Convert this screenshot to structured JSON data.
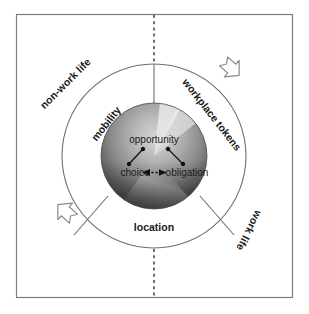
{
  "figure": {
    "frame": {
      "border_color": "#7a7a7a",
      "background": "#ffffff"
    },
    "divider": {
      "name": "vertical-dashed-divider",
      "style": "dashed",
      "color": "#555555",
      "description": "vertical dashed line splitting non-work life from work life"
    },
    "quadrant_labels": [
      {
        "key": "non_work_life",
        "text": "non-work life",
        "position": "upper-left",
        "rotation": -45
      },
      {
        "key": "workplace_tokens",
        "text": "workplace tokens",
        "position": "upper-right",
        "rotation": 52
      },
      {
        "key": "work_life",
        "text": "work life",
        "position": "lower-right",
        "rotation": 117
      }
    ],
    "ring": {
      "name": "outer-ring",
      "stroke": "#6f6f6f",
      "fill": "#ffffff",
      "segments": [
        {
          "key": "mobility",
          "text": "mobility",
          "position": "upper-left",
          "rotation": -52
        },
        {
          "key": "workplace_tokens_ring",
          "text": "workplace tokens",
          "position": "upper-right",
          "rotation": 52
        },
        {
          "key": "location",
          "text": "location",
          "position": "bottom",
          "rotation": 0
        }
      ]
    },
    "core": {
      "name": "inner-sphere",
      "gradient_light": "#d8d8d8",
      "gradient_mid": "#8e8e8e",
      "gradient_dark": "#3b3b3b",
      "nodes": [
        {
          "key": "opportunity",
          "text": "opportunity",
          "position": "top"
        },
        {
          "key": "choice",
          "text": "choice",
          "position": "bottom-left"
        },
        {
          "key": "obligation",
          "text": "obligation",
          "position": "bottom-right"
        }
      ],
      "connectors": [
        {
          "from": "opportunity",
          "to": "choice",
          "style": "solid-arrow"
        },
        {
          "from": "opportunity",
          "to": "obligation",
          "style": "solid-arrow"
        },
        {
          "from": "choice",
          "to": "obligation",
          "style": "dashed-double-arrow"
        }
      ]
    },
    "rotation_arrows": [
      {
        "key": "arrow_top_right",
        "name": "rotation-arrow-clockwise-top-right",
        "direction": "down-right"
      },
      {
        "key": "arrow_bottom_left",
        "name": "rotation-arrow-clockwise-bottom-left",
        "direction": "up-left"
      }
    ]
  }
}
